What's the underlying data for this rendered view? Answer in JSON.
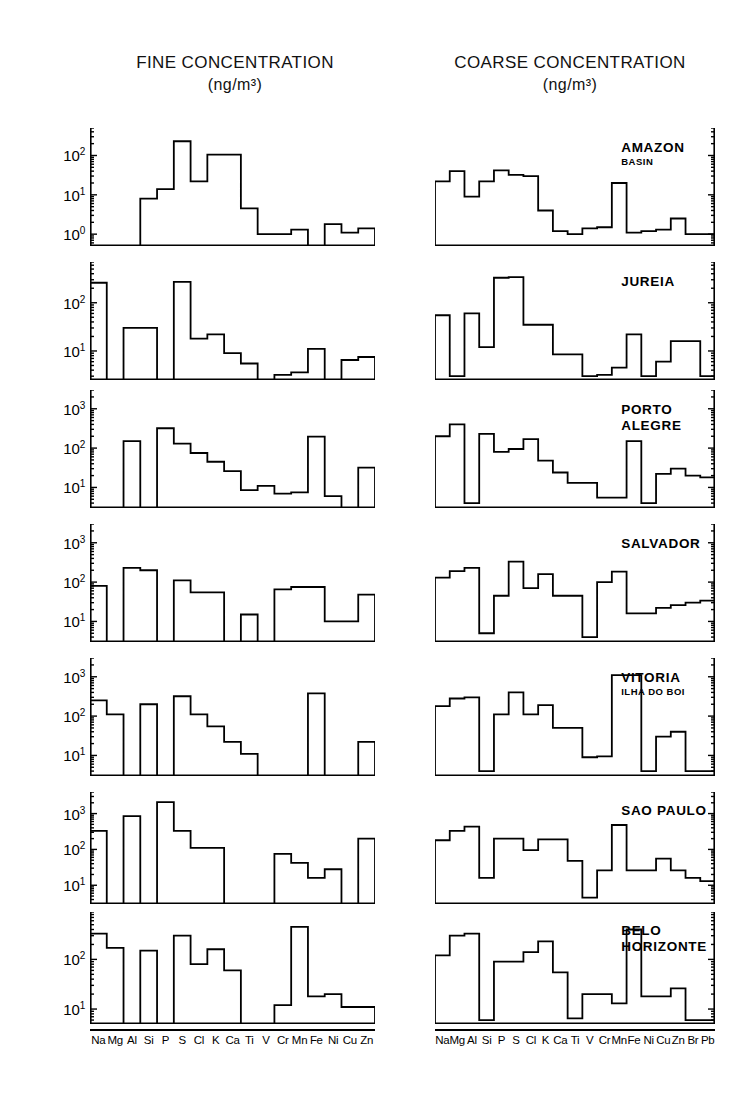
{
  "titles": {
    "fine": "FINE CONCENTRATION",
    "fine_unit": "(ng/m³)",
    "coarse": "COARSE CONCENTRATION",
    "coarse_unit": "(ng/m³)"
  },
  "sites": [
    {
      "name": "AMAZON",
      "sub": "BASIN"
    },
    {
      "name": "JUREIA",
      "sub": ""
    },
    {
      "name": "PORTO",
      "sub": "ALEGRE"
    },
    {
      "name": "SALVADOR",
      "sub": ""
    },
    {
      "name": "VITORIA",
      "sub": "ILHA DO BOI"
    },
    {
      "name": "SAO PAULO",
      "sub": ""
    },
    {
      "name": "BELO",
      "sub": "HORIZONTE"
    }
  ],
  "axis_elements_fine": [
    "Na",
    "Mg",
    "Al",
    "Si",
    "P",
    "S",
    "Cl",
    "K",
    "Ca",
    "Ti",
    "V",
    "Cr",
    "Mn",
    "Fe",
    "Ni",
    "Cu",
    "Zn"
  ],
  "axis_elements_coarse": [
    "Na",
    "Mg",
    "Al",
    "Si",
    "P",
    "S",
    "Cl",
    "K",
    "Ca",
    "Ti",
    "V",
    "Cr",
    "Mn",
    "Fe",
    "Ni",
    "Cu",
    "Zn",
    "Br",
    "Pb"
  ],
  "y_tick_labels": {
    "e0": "10⁰",
    "e1": "10¹",
    "e2": "10²",
    "e3": "10³"
  },
  "chart_data": {
    "type": "bar",
    "xlabel": "",
    "ylabel": "Concentration (ng/m³)",
    "scale": "log",
    "grid": false,
    "legend": "none",
    "panels": [
      {
        "site": "AMAZON BASIN",
        "fine": {
          "ylim": [
            0.5,
            500
          ],
          "yticks": [
            1,
            10,
            100
          ],
          "ytick_labels": [
            "10⁰",
            "10¹",
            "10²"
          ],
          "categories": [
            "Na",
            "Mg",
            "Al",
            "Si",
            "P",
            "S",
            "Cl",
            "K",
            "Ca",
            "Ti",
            "V",
            "Cr",
            "Mn",
            "Fe",
            "Ni",
            "Cu",
            "Zn"
          ],
          "values": [
            null,
            null,
            null,
            8,
            14,
            230,
            22,
            105,
            105,
            4.5,
            1.0,
            1.0,
            1.3,
            null,
            1.8,
            1.1,
            1.4
          ]
        },
        "coarse": {
          "ylim": [
            0.5,
            500
          ],
          "yticks": [
            1,
            10,
            100
          ],
          "categories": [
            "Na",
            "Mg",
            "Al",
            "Si",
            "P",
            "S",
            "Cl",
            "K",
            "Ca",
            "Ti",
            "V",
            "Cr",
            "Mn",
            "Fe",
            "Ni",
            "Cu",
            "Zn",
            "Br",
            "Pb"
          ],
          "values": [
            22,
            40,
            9,
            22,
            42,
            32,
            30,
            4.0,
            1.2,
            1.0,
            1.4,
            1.5,
            20,
            1.1,
            1.2,
            1.3,
            2.5,
            1.0,
            1.0
          ]
        }
      },
      {
        "site": "JUREIA",
        "fine": {
          "ylim": [
            2.5,
            700
          ],
          "yticks": [
            10,
            100
          ],
          "ytick_labels": [
            "10¹",
            "10²"
          ],
          "categories": [
            "Na",
            "Mg",
            "Al",
            "Si",
            "P",
            "S",
            "Cl",
            "K",
            "Ca",
            "Ti",
            "V",
            "Cr",
            "Mn",
            "Fe",
            "Ni",
            "Cu",
            "Zn"
          ],
          "values": [
            260,
            null,
            30,
            30,
            null,
            270,
            18,
            22,
            9,
            5.5,
            null,
            3.2,
            3.6,
            11,
            null,
            6.5,
            7.5
          ]
        },
        "coarse": {
          "ylim": [
            2.5,
            700
          ],
          "yticks": [
            10,
            100
          ],
          "categories": [
            "Na",
            "Mg",
            "Al",
            "Si",
            "P",
            "S",
            "Cl",
            "K",
            "Ca",
            "Ti",
            "V",
            "Cr",
            "Mn",
            "Fe",
            "Ni",
            "Cu",
            "Zn",
            "Br",
            "Pb"
          ],
          "values": [
            55,
            3.0,
            60,
            12,
            330,
            340,
            35,
            35,
            8.5,
            8.5,
            3.0,
            3.2,
            4.5,
            22,
            3.0,
            6.0,
            16,
            16,
            3.0
          ]
        }
      },
      {
        "site": "PORTO ALEGRE",
        "fine": {
          "ylim": [
            3,
            3000
          ],
          "yticks": [
            10,
            100,
            1000
          ],
          "ytick_labels": [
            "10¹",
            "10²",
            "10³"
          ],
          "categories": [
            "Na",
            "Mg",
            "Al",
            "Si",
            "P",
            "S",
            "Cl",
            "K",
            "Ca",
            "Ti",
            "V",
            "Cr",
            "Mn",
            "Fe",
            "Ni",
            "Cu",
            "Zn"
          ],
          "values": [
            null,
            null,
            150,
            null,
            320,
            130,
            75,
            45,
            26,
            8.5,
            11,
            7.0,
            7.5,
            195,
            6.0,
            null,
            32
          ]
        },
        "coarse": {
          "ylim": [
            3,
            3000
          ],
          "yticks": [
            10,
            100,
            1000
          ],
          "categories": [
            "Na",
            "Mg",
            "Al",
            "Si",
            "P",
            "S",
            "Cl",
            "K",
            "Ca",
            "Ti",
            "V",
            "Cr",
            "Mn",
            "Fe",
            "Ni",
            "Cu",
            "Zn",
            "Br",
            "Pb"
          ],
          "values": [
            200,
            400,
            4.0,
            230,
            80,
            95,
            170,
            48,
            24,
            13,
            13,
            5.5,
            5.5,
            150,
            4.0,
            22,
            30,
            20,
            18
          ]
        }
      },
      {
        "site": "SALVADOR",
        "fine": {
          "ylim": [
            3,
            3000
          ],
          "yticks": [
            10,
            100,
            1000
          ],
          "ytick_labels": [
            "10¹",
            "10²",
            "10³"
          ],
          "categories": [
            "Na",
            "Mg",
            "Al",
            "Si",
            "P",
            "S",
            "Cl",
            "K",
            "Ca",
            "Ti",
            "V",
            "Cr",
            "Mn",
            "Fe",
            "Ni",
            "Cu",
            "Zn"
          ],
          "values": [
            80,
            null,
            230,
            200,
            null,
            110,
            55,
            55,
            null,
            15,
            null,
            65,
            75,
            75,
            10,
            10,
            48
          ]
        },
        "coarse": {
          "ylim": [
            3,
            3000
          ],
          "yticks": [
            10,
            100,
            1000
          ],
          "categories": [
            "Na",
            "Mg",
            "Al",
            "Si",
            "P",
            "S",
            "Cl",
            "K",
            "Ca",
            "Ti",
            "V",
            "Cr",
            "Mn",
            "Fe",
            "Ni",
            "Cu",
            "Zn",
            "Br",
            "Pb"
          ],
          "values": [
            130,
            190,
            230,
            5.0,
            45,
            330,
            70,
            160,
            45,
            45,
            4.0,
            100,
            185,
            16,
            16,
            22,
            26,
            30,
            34
          ]
        }
      },
      {
        "site": "VITORIA ILHA DO BOI",
        "fine": {
          "ylim": [
            3,
            3000
          ],
          "yticks": [
            10,
            100,
            1000
          ],
          "ytick_labels": [
            "10¹",
            "10²",
            "10³"
          ],
          "categories": [
            "Na",
            "Mg",
            "Al",
            "Si",
            "P",
            "S",
            "Cl",
            "K",
            "Ca",
            "Ti",
            "V",
            "Cr",
            "Mn",
            "Fe",
            "Ni",
            "Cu",
            "Zn"
          ],
          "values": [
            250,
            110,
            null,
            200,
            null,
            320,
            110,
            55,
            22,
            11,
            null,
            null,
            null,
            380,
            null,
            null,
            22
          ]
        },
        "coarse": {
          "ylim": [
            3,
            3000
          ],
          "yticks": [
            10,
            100,
            1000
          ],
          "categories": [
            "Na",
            "Mg",
            "Al",
            "Si",
            "P",
            "S",
            "Cl",
            "K",
            "Ca",
            "Ti",
            "V",
            "Cr",
            "Mn",
            "Fe",
            "Ni",
            "Cu",
            "Zn",
            "Br",
            "Pb"
          ],
          "values": [
            180,
            280,
            300,
            4.0,
            110,
            400,
            110,
            190,
            50,
            50,
            9.0,
            9.5,
            1100,
            1100,
            4.0,
            30,
            40,
            4.0,
            4.0
          ]
        }
      },
      {
        "site": "SAO PAULO",
        "fine": {
          "ylim": [
            3,
            4000
          ],
          "yticks": [
            10,
            100,
            1000
          ],
          "ytick_labels": [
            "10¹",
            "10²",
            "10³"
          ],
          "categories": [
            "Na",
            "Mg",
            "Al",
            "Si",
            "P",
            "S",
            "Cl",
            "K",
            "Ca",
            "Ti",
            "V",
            "Cr",
            "Mn",
            "Fe",
            "Ni",
            "Cu",
            "Zn"
          ],
          "values": [
            330,
            null,
            850,
            null,
            2100,
            330,
            110,
            110,
            null,
            null,
            null,
            75,
            42,
            16,
            28,
            null,
            200
          ]
        },
        "coarse": {
          "ylim": [
            3,
            4000
          ],
          "yticks": [
            10,
            100,
            1000
          ],
          "categories": [
            "Na",
            "Mg",
            "Al",
            "Si",
            "P",
            "S",
            "Cl",
            "K",
            "Ca",
            "Ti",
            "V",
            "Cr",
            "Mn",
            "Fe",
            "Ni",
            "Cu",
            "Zn",
            "Br",
            "Pb"
          ],
          "values": [
            180,
            330,
            430,
            16,
            200,
            200,
            95,
            190,
            190,
            48,
            4.5,
            26,
            480,
            26,
            26,
            55,
            26,
            16,
            13
          ]
        }
      },
      {
        "site": "BELO HORIZONTE",
        "fine": {
          "ylim": [
            5,
            900
          ],
          "yticks": [
            10,
            100
          ],
          "ytick_labels": [
            "10¹",
            "10²"
          ],
          "categories": [
            "Na",
            "Mg",
            "Al",
            "Si",
            "P",
            "S",
            "Cl",
            "K",
            "Ca",
            "Ti",
            "V",
            "Cr",
            "Mn",
            "Fe",
            "Ni",
            "Cu",
            "Zn"
          ],
          "values": [
            330,
            170,
            null,
            150,
            null,
            300,
            80,
            160,
            60,
            null,
            null,
            12,
            450,
            18,
            20,
            11,
            11
          ]
        },
        "coarse": {
          "ylim": [
            5,
            900
          ],
          "yticks": [
            10,
            100
          ],
          "categories": [
            "Na",
            "Mg",
            "Al",
            "Si",
            "P",
            "S",
            "Cl",
            "K",
            "Ca",
            "Ti",
            "V",
            "Cr",
            "Mn",
            "Fe",
            "Ni",
            "Cu",
            "Zn",
            "Br",
            "Pb"
          ],
          "values": [
            120,
            300,
            330,
            6.0,
            90,
            90,
            140,
            230,
            55,
            6.5,
            20,
            20,
            13,
            400,
            18,
            18,
            26,
            6.0,
            6.0
          ]
        }
      }
    ]
  }
}
